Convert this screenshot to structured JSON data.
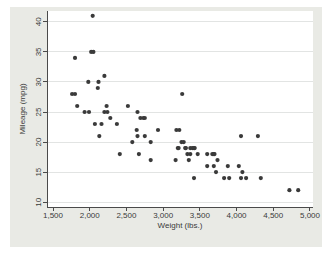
{
  "chart_data": {
    "type": "scatter",
    "title": "",
    "xlabel": "Weight (lbs.)",
    "ylabel": "Mileage (mpg)",
    "xlim": [
      1418,
      5041
    ],
    "ylim": [
      9.2,
      41.8
    ],
    "xticks": [
      1500,
      2000,
      2500,
      3000,
      3500,
      4000,
      4500,
      5000
    ],
    "xtick_labels": [
      "1,500",
      "2,000",
      "2,500",
      "3,000",
      "3,500",
      "4,000",
      "4,500",
      "5,000"
    ],
    "yticks": [
      10,
      15,
      20,
      25,
      30,
      35,
      40
    ],
    "ytick_labels": [
      "10",
      "15",
      "20",
      "25",
      "30",
      "35",
      "40"
    ],
    "grid": "horizontal",
    "legend_position": "none",
    "colors": {
      "page_background": "#ffffff",
      "graph_background": "#e9eae5",
      "plot_background": "#ffffff",
      "gridline": "#e2e4e3",
      "axis": "#4a4a4a",
      "marker": "#3a3a3a",
      "text": "#3a3a3a"
    },
    "series_name": "weight_vs_mpg",
    "points": [
      [
        2930,
        22
      ],
      [
        3350,
        17
      ],
      [
        2640,
        22
      ],
      [
        3250,
        20
      ],
      [
        4080,
        15
      ],
      [
        3670,
        18
      ],
      [
        2230,
        26
      ],
      [
        3280,
        20
      ],
      [
        3880,
        16
      ],
      [
        3400,
        19
      ],
      [
        4330,
        14
      ],
      [
        3900,
        14
      ],
      [
        4290,
        21
      ],
      [
        2110,
        29
      ],
      [
        3690,
        16
      ],
      [
        3180,
        22
      ],
      [
        3220,
        22
      ],
      [
        2750,
        24
      ],
      [
        3430,
        19
      ],
      [
        2120,
        30
      ],
      [
        3600,
        18
      ],
      [
        3600,
        16
      ],
      [
        3740,
        17
      ],
      [
        1800,
        28
      ],
      [
        2650,
        21
      ],
      [
        4840,
        12
      ],
      [
        4720,
        12
      ],
      [
        3830,
        14
      ],
      [
        2580,
        20
      ],
      [
        4060,
        14
      ],
      [
        3720,
        15
      ],
      [
        3370,
        18
      ],
      [
        4130,
        14
      ],
      [
        2830,
        20
      ],
      [
        4060,
        21
      ],
      [
        3310,
        19
      ],
      [
        3300,
        19
      ],
      [
        3690,
        18
      ],
      [
        3370,
        19
      ],
      [
        2730,
        24
      ],
      [
        4030,
        16
      ],
      [
        3260,
        28
      ],
      [
        1800,
        34
      ],
      [
        2200,
        25
      ],
      [
        2520,
        26
      ],
      [
        3330,
        18
      ],
      [
        3700,
        18
      ],
      [
        3470,
        18
      ],
      [
        3210,
        19
      ],
      [
        3200,
        19
      ],
      [
        3420,
        19
      ],
      [
        2690,
        24
      ],
      [
        2830,
        17
      ],
      [
        2070,
        23
      ],
      [
        2650,
        25
      ],
      [
        2370,
        23
      ],
      [
        2020,
        35
      ],
      [
        2280,
        24
      ],
      [
        2750,
        21
      ],
      [
        2130,
        21
      ],
      [
        2240,
        25
      ],
      [
        1760,
        28
      ],
      [
        1980,
        30
      ],
      [
        3420,
        14
      ],
      [
        1830,
        26
      ],
      [
        2050,
        35
      ],
      [
        2410,
        18
      ],
      [
        2200,
        31
      ],
      [
        2670,
        18
      ],
      [
        2160,
        23
      ],
      [
        2040,
        41
      ],
      [
        1930,
        25
      ],
      [
        1990,
        25
      ],
      [
        3170,
        17
      ]
    ]
  }
}
